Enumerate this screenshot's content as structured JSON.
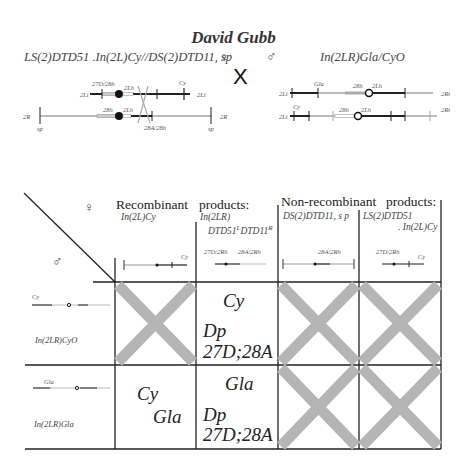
{
  "title": "David Gubb",
  "cross": {
    "female_genotype": "LS(2)DTD51 .In(2L)Cy//DS(2)DTD11, sp",
    "female_symbol": "♀",
    "cross_symbol": "X",
    "male_symbol": "♂",
    "male_genotype": "In(2LR)Gla/CyO"
  },
  "female_maps": {
    "top_labels": [
      "27D/28h",
      "2Lh",
      "Cy"
    ],
    "top_ends": [
      "2Lt",
      "2Lt"
    ],
    "bottom_labels": [
      "28h",
      "2Lh",
      "28A/28h"
    ],
    "bottom_ends": [
      "2R",
      "2R"
    ],
    "bottom_markers": [
      "sp",
      "sp"
    ]
  },
  "male_maps": {
    "top_labels": [
      "Gla",
      "28h",
      "2Lh"
    ],
    "top_ends": [
      "2Lt",
      "2Rt"
    ],
    "bottom_labels": [
      "Cy",
      "28h",
      "2Lh"
    ],
    "bottom_ends": [
      "2Lt",
      "2Rt"
    ]
  },
  "table": {
    "corner_female": "♀",
    "corner_male": "♂",
    "recombinant_header": "Recombinant",
    "recombinant_header_2": "products:",
    "nonrecombinant_header": "Non-recombinant",
    "nonrecombinant_header_2": "products:",
    "columns": [
      {
        "label": "In(2L)Cy",
        "map_labels": [
          "Cy"
        ]
      },
      {
        "label": "In(2LR)",
        "label2": "DTD51",
        "sup1": "L",
        "label3": "DTD11",
        "sup2": "R",
        "map_labels": [
          "27D/2Rh",
          "28A/2Rh"
        ]
      },
      {
        "label": "DS(2)DTD11, s p",
        "map_labels": [
          "28A/2Rh"
        ]
      },
      {
        "label": "LS(2)DTD51",
        "label2": ". In(2L)Cy",
        "map_labels": [
          "27D/2Rh",
          "Cy"
        ]
      }
    ],
    "rows": [
      {
        "label": "In(2LR)CyO",
        "map_label": "Cy"
      },
      {
        "label": "In(2LR)Gla",
        "map_label": "Gla"
      }
    ],
    "cells": [
      [
        {
          "lethal": true
        },
        {
          "lethal": false,
          "line1": "Cy",
          "line2": "Dp",
          "line3": "27D;28A"
        },
        {
          "lethal": true
        },
        {
          "lethal": true
        }
      ],
      [
        {
          "lethal": false,
          "line1": "Cy",
          "line2": "Gla"
        },
        {
          "lethal": false,
          "line1": "Gla",
          "line2": "Dp",
          "line3": "27D;28A"
        },
        {
          "lethal": true
        },
        {
          "lethal": true
        }
      ]
    ],
    "colors": {
      "lethal_cross": "#b5b5b5",
      "grid": "#222222"
    }
  }
}
